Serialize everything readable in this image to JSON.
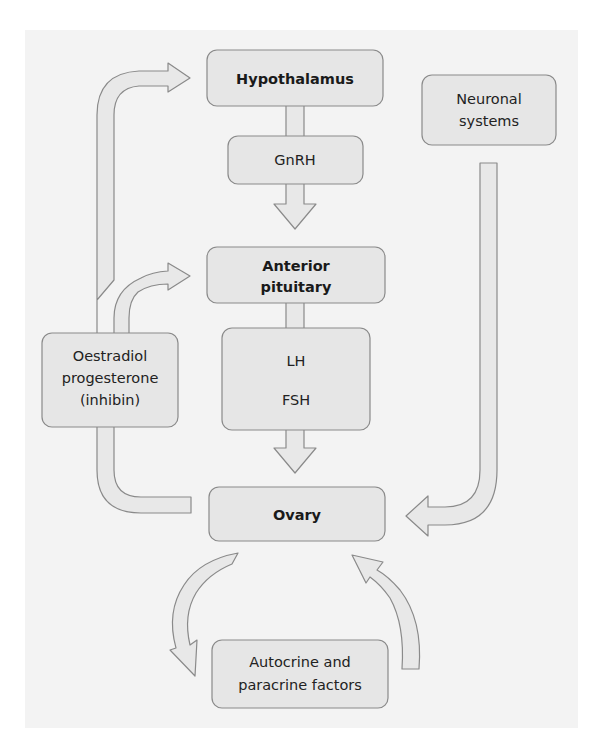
{
  "diagram": {
    "type": "flow-diagram",
    "colors": {
      "background": "#ffffff",
      "panel": "#f3f3f3",
      "box_fill": "#e6e6e6",
      "box_stroke": "#8a8a8a",
      "arrow_fill": "#e8e8e8",
      "text": "#222222"
    },
    "nodes": {
      "hypothalamus": {
        "label": "Hypothalamus",
        "bold": true
      },
      "gnrh": {
        "label": "GnRH",
        "bold": false
      },
      "anterior_pituitary": {
        "lines": [
          "Anterior",
          "pituitary"
        ],
        "bold": true
      },
      "gonadotropins": {
        "lines": [
          "LH",
          "FSH"
        ],
        "bold": false
      },
      "ovary": {
        "label": "Ovary",
        "bold": true
      },
      "neuronal_systems": {
        "lines": [
          "Neuronal",
          "systems"
        ],
        "bold": false
      },
      "ovarian_steroids": {
        "lines": [
          "Oestradiol",
          "progesterone",
          "(inhibin)"
        ],
        "bold": false
      },
      "local_factors": {
        "lines": [
          "Autocrine and",
          "paracrine factors"
        ],
        "bold": false
      }
    },
    "edges": [
      {
        "from": "Hypothalamus",
        "to": "GnRH",
        "style": "stem"
      },
      {
        "from": "GnRH",
        "to": "Anterior pituitary",
        "style": "down-arrow"
      },
      {
        "from": "Anterior pituitary",
        "to": "LH FSH",
        "style": "stem"
      },
      {
        "from": "LH FSH",
        "to": "Ovary",
        "style": "down-arrow"
      },
      {
        "from": "Neuronal systems",
        "to": "Ovary",
        "style": "curved-arrow"
      },
      {
        "from": "Ovary",
        "to": "Oestradiol progesterone (inhibin)",
        "style": "curved-connector"
      },
      {
        "from": "Oestradiol progesterone (inhibin)",
        "to": "Hypothalamus",
        "style": "curved-arrow (feedback)"
      },
      {
        "from": "Oestradiol progesterone (inhibin)",
        "to": "Anterior pituitary",
        "style": "curved-arrow (feedback)"
      },
      {
        "from": "Ovary",
        "to": "Autocrine and paracrine factors",
        "style": "curved-arrow"
      },
      {
        "from": "Autocrine and paracrine factors",
        "to": "Ovary",
        "style": "curved-arrow"
      }
    ]
  }
}
